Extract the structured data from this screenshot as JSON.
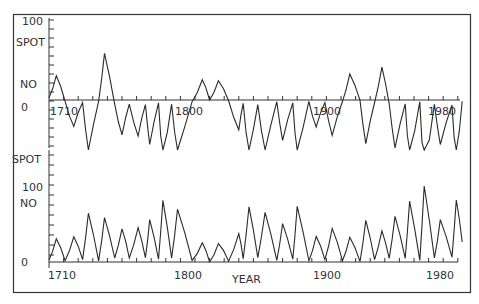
{
  "figure": {
    "frame_color": "#333333",
    "line_color": "#2a2a2a",
    "background": "#ffffff"
  },
  "chart_data": [
    {
      "type": "line",
      "title": "",
      "panel": "top",
      "description": "Alternating-sign (Hale cycle) sunspot number",
      "xlabel": "",
      "ylabel_lines": [
        "100",
        "SPOT",
        "NO",
        "0"
      ],
      "xlim": [
        1700,
        1985
      ],
      "ylim": [
        -130,
        100
      ],
      "xticks": [
        1710,
        1800,
        1900,
        1980
      ],
      "xtick_labels": [
        "1710",
        "1800",
        "1900",
        "1980"
      ],
      "grid": false,
      "x": [
        1700,
        1705,
        1711,
        1717,
        1723,
        1727,
        1734,
        1738,
        1745,
        1750,
        1755,
        1761,
        1766,
        1769,
        1775,
        1778,
        1784,
        1788,
        1798,
        1805,
        1810,
        1816,
        1823,
        1830,
        1833,
        1837,
        1843,
        1848,
        1856,
        1860,
        1867,
        1870,
        1878,
        1883,
        1889,
        1894,
        1901,
        1906,
        1913,
        1917,
        1923,
        1928,
        1933,
        1937,
        1944,
        1947,
        1954,
        1957,
        1964,
        1968,
        1976,
        1979,
        1983
      ],
      "values": [
        5,
        58,
        -3,
        -63,
        -6,
        -122,
        -3,
        111,
        -10,
        -83,
        -10,
        -86,
        -11,
        -106,
        -7,
        -154,
        -10,
        -132,
        -4,
        48,
        0,
        46,
        -2,
        -71,
        -8,
        -138,
        -11,
        -124,
        -4,
        -96,
        -7,
        -139,
        -3,
        -64,
        -6,
        -84,
        -3,
        62,
        -1,
        -104,
        -6,
        78,
        -9,
        -114,
        -9,
        -152,
        -4,
        -190,
        -10,
        -106,
        -12,
        -155,
        -3
      ],
      "note": "Signs as drawn: positive lobes above zero axis, negative below; values approximate from pixels"
    },
    {
      "type": "line",
      "title": "",
      "panel": "bottom",
      "description": "Annual sunspot number",
      "xlabel": "YEAR",
      "ylabel_lines": [
        "SPOT",
        "100",
        "NO",
        "0"
      ],
      "xlim": [
        1700,
        1985
      ],
      "ylim": [
        0,
        170
      ],
      "xticks": [
        1710,
        1800,
        1900,
        1980
      ],
      "xtick_labels": [
        "1710",
        "1800",
        "1900",
        "1980"
      ],
      "grid": false,
      "x": [
        1700,
        1705,
        1711,
        1717,
        1723,
        1727,
        1734,
        1738,
        1745,
        1750,
        1755,
        1761,
        1766,
        1769,
        1775,
        1778,
        1784,
        1788,
        1798,
        1805,
        1810,
        1816,
        1823,
        1830,
        1833,
        1837,
        1843,
        1848,
        1856,
        1860,
        1867,
        1870,
        1878,
        1883,
        1889,
        1894,
        1901,
        1906,
        1913,
        1917,
        1923,
        1928,
        1933,
        1937,
        1944,
        1947,
        1954,
        1957,
        1964,
        1968,
        1976,
        1979,
        1983
      ],
      "values": [
        5,
        58,
        3,
        63,
        6,
        122,
        3,
        111,
        10,
        83,
        10,
        86,
        11,
        106,
        7,
        154,
        10,
        132,
        4,
        48,
        0,
        46,
        2,
        71,
        8,
        138,
        11,
        124,
        4,
        96,
        7,
        139,
        3,
        64,
        6,
        84,
        3,
        62,
        1,
        104,
        6,
        78,
        9,
        114,
        9,
        152,
        4,
        190,
        10,
        106,
        12,
        155,
        50
      ]
    }
  ],
  "labels": {
    "top_100": "100",
    "top_spot": "SPOT",
    "top_no": "NO",
    "top_zero": "0",
    "bottom_spot": "SPOT",
    "bottom_100": "100",
    "bottom_no": "NO",
    "bottom_zero": "0",
    "x_1710_top": "1710",
    "x_1800_top": "1800",
    "x_1900_top": "1900",
    "x_1980_top": "1980",
    "x_1710": "1710",
    "x_1800": "1800",
    "x_1900": "1900",
    "x_1980": "1980",
    "year": "YEAR"
  }
}
